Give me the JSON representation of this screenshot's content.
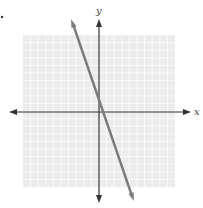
{
  "chart_data": {
    "type": "line",
    "title": "",
    "xlabel": "x",
    "ylabel": "y",
    "xlim": [
      -10,
      10
    ],
    "ylim": [
      -10,
      10
    ],
    "grid": true,
    "tick_labels": false,
    "series": [
      {
        "name": "line",
        "equation": "y = -3x",
        "slope": -3,
        "intercept": 0,
        "x": [
          -3.4,
          4.5
        ],
        "y": [
          10.2,
          -13.5
        ]
      }
    ]
  },
  "labels": {
    "x_axis": "x",
    "y_axis": "y"
  },
  "colors": {
    "grid_bg": "#ececec",
    "grid_line": "#fafafa",
    "axis": "#333333",
    "line": "#7a7a7a"
  }
}
